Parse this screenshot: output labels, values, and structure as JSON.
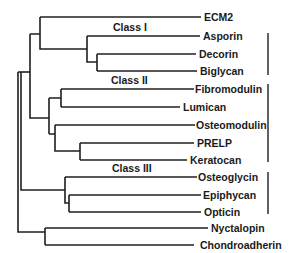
{
  "diagram": {
    "type": "dendrogram",
    "leaves": [
      {
        "label": "ECM2",
        "y": 17,
        "end_x": 201
      },
      {
        "label": "Asporin",
        "y": 36,
        "end_x": 200
      },
      {
        "label": "Decorin",
        "y": 54,
        "end_x": 196
      },
      {
        "label": "Biglycan",
        "y": 71,
        "end_x": 197
      },
      {
        "label": "Fibromodulin",
        "y": 89,
        "end_x": 194
      },
      {
        "label": "Lumican",
        "y": 107,
        "end_x": 180
      },
      {
        "label": "Osteomodulin",
        "y": 125,
        "end_x": 195
      },
      {
        "label": "PRELP",
        "y": 143,
        "end_x": 194
      },
      {
        "label": "Keratocan",
        "y": 160,
        "end_x": 187
      },
      {
        "label": "Osteoglycin",
        "y": 177,
        "end_x": 197
      },
      {
        "label": "Epiphycan",
        "y": 195,
        "end_x": 201
      },
      {
        "label": "Opticin",
        "y": 212,
        "end_x": 201
      },
      {
        "label": "Nyctalopin",
        "y": 228,
        "end_x": 208
      },
      {
        "label": "Chondroadherin",
        "y": 245,
        "end_x": 194
      }
    ],
    "classes": [
      {
        "label": "Class I",
        "label_x": 113,
        "label_y": 30,
        "bracket_y1": 33,
        "bracket_y2": 75
      },
      {
        "label": "Class II",
        "label_x": 111,
        "label_y": 84,
        "bracket_y1": 84,
        "bracket_y2": 162
      },
      {
        "label": "Class III",
        "label_x": 112,
        "label_y": 172,
        "bracket_y1": 172,
        "bracket_y2": 214
      }
    ],
    "bracket_x": 268
  }
}
